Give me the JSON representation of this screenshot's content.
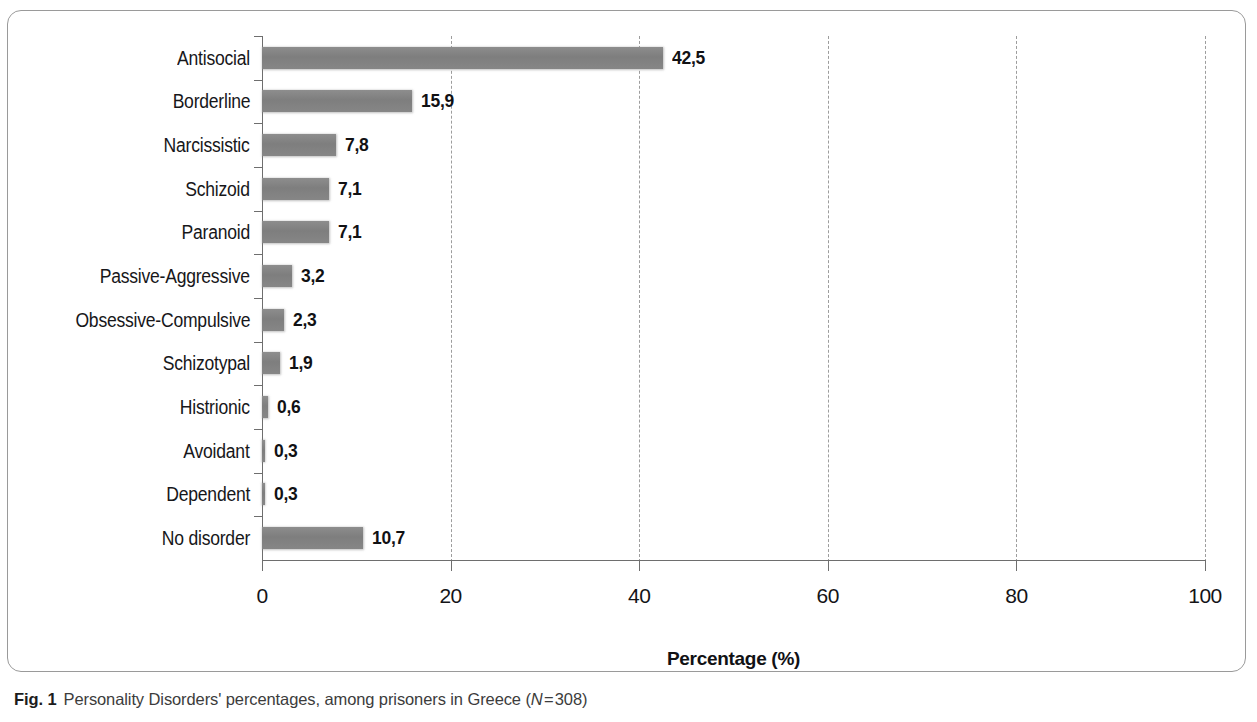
{
  "figure": {
    "caption_label": "Fig. 1",
    "caption_text_before_n": "Personality Disorders' percentages, among prisoners in Greece (",
    "caption_n_symbol": "N",
    "caption_text_after_n": " = 308)"
  },
  "chart_data": {
    "type": "bar",
    "orientation": "horizontal",
    "title": "",
    "xlabel": "Percentage (%)",
    "ylabel": "",
    "xlim": [
      0,
      100
    ],
    "xticks": [
      0,
      20,
      40,
      60,
      80,
      100
    ],
    "xtick_labels": [
      "0",
      "20",
      "40",
      "60",
      "80",
      "100"
    ],
    "grid": "vertical-dashed",
    "legend": "none",
    "bar_color": "#808080",
    "categories": [
      "Antisocial",
      "Borderline",
      "Narcissistic",
      "Schizoid",
      "Paranoid",
      "Passive-Aggressive",
      "Obsessive-Compulsive",
      "Schizotypal",
      "Histrionic",
      "Avoidant",
      "Dependent",
      "No disorder"
    ],
    "values": [
      42.5,
      15.9,
      7.8,
      7.1,
      7.1,
      3.2,
      2.3,
      1.9,
      0.6,
      0.3,
      0.3,
      10.7
    ],
    "value_labels": [
      "42,5",
      "15,9",
      "7,8",
      "7,1",
      "7,1",
      "3,2",
      "2,3",
      "1,9",
      "0,6",
      "0,3",
      "0,3",
      "10,7"
    ]
  }
}
